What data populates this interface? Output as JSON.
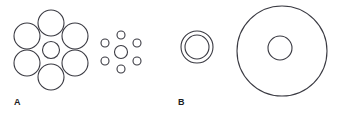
{
  "figure": {
    "background_color": "#ffffff",
    "stroke_color": "#3a3a42",
    "fill_color": "none",
    "stroke_width": 1.1,
    "width": 344,
    "height": 123
  },
  "panels": [
    {
      "id": "panel-a",
      "label": "A",
      "label_x": 14,
      "label_y": 105,
      "illusion_name": "Ebbinghaus illusion",
      "groups": [
        {
          "id": "large-inducers-group",
          "name": "target-with-large-surrounding-circles",
          "target": {
            "cx": 51,
            "cy": 50,
            "r": 8.5
          },
          "inducers": [
            {
              "cx": 51,
              "cy": 23,
              "r": 13
            },
            {
              "cx": 75,
              "cy": 36,
              "r": 13
            },
            {
              "cx": 75,
              "cy": 63,
              "r": 13
            },
            {
              "cx": 51,
              "cy": 77,
              "r": 13
            },
            {
              "cx": 27,
              "cy": 63,
              "r": 13
            },
            {
              "cx": 27,
              "cy": 36,
              "r": 13
            }
          ]
        },
        {
          "id": "small-inducers-group",
          "name": "target-with-small-surrounding-circles",
          "target": {
            "cx": 121,
            "cy": 52,
            "r": 6.5
          },
          "inducers": [
            {
              "cx": 121,
              "cy": 35,
              "r": 4
            },
            {
              "cx": 137,
              "cy": 43,
              "r": 4
            },
            {
              "cx": 137,
              "cy": 61,
              "r": 4
            },
            {
              "cx": 121,
              "cy": 69,
              "r": 4
            },
            {
              "cx": 105,
              "cy": 61,
              "r": 4
            },
            {
              "cx": 105,
              "cy": 43,
              "r": 4
            }
          ]
        }
      ]
    },
    {
      "id": "panel-b",
      "label": "B",
      "label_x": 178,
      "label_y": 105,
      "illusion_name": "Delboeuf illusion",
      "groups": [
        {
          "id": "small-annulus-group",
          "name": "target-with-close-fitting-ring",
          "target": {
            "cx": 197,
            "cy": 47,
            "r": 12
          },
          "ring": {
            "cx": 197,
            "cy": 47,
            "r": 16
          }
        },
        {
          "id": "large-annulus-group",
          "name": "target-with-large-surrounding-ring",
          "target": {
            "cx": 280,
            "cy": 48,
            "r": 12
          },
          "ring": {
            "cx": 282,
            "cy": 51,
            "r": 45
          }
        }
      ]
    }
  ]
}
